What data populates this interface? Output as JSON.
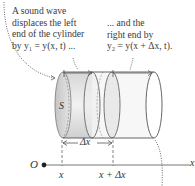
{
  "annotations": {
    "left": [
      "A sound wave",
      "displaces the left",
      "end of the cylinder",
      "by y₁ = y(x, t) ..."
    ],
    "right": [
      "... and the",
      "right end by",
      "y₂ = y(x + Δx, t)."
    ]
  },
  "labels": {
    "area": "S",
    "delta_x": "Δx",
    "origin": "O",
    "x_tick_1": "x",
    "x_tick_2": "x + Δx",
    "axis": "x"
  },
  "colors": {
    "outline": "#555555",
    "shade_dark": "#c9c9c9",
    "shade_light": "#ececec",
    "text": "#3a3a3a"
  }
}
